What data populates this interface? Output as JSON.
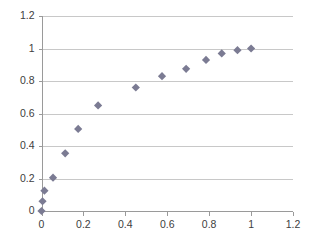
{
  "chart_data": {
    "type": "scatter",
    "title": "",
    "subtitle": "",
    "xlabel": "",
    "ylabel": "",
    "xlim": [
      0,
      1.2
    ],
    "ylim": [
      0,
      1.2
    ],
    "xticks": [
      "0",
      "0.2",
      "0.4",
      "0.6",
      "0.8",
      "1",
      "1.2"
    ],
    "xtick_values": [
      0,
      0.2,
      0.4,
      0.6,
      0.8,
      1,
      1.2
    ],
    "yticks": [
      "0",
      "0.2",
      "0.4",
      "0.6",
      "0.8",
      "1",
      "1.2"
    ],
    "ytick_values": [
      0,
      0.2,
      0.4,
      0.6,
      0.8,
      1,
      1.2
    ],
    "grid": {
      "horizontal": true,
      "vertical": false,
      "color": "#c8c8c8"
    },
    "legend": {
      "visible": false,
      "position": "none",
      "entries": []
    },
    "annotations": [],
    "series": [
      {
        "name": "Series 1",
        "marker": "diamond",
        "color": "#7b7b93",
        "marker_size": 7,
        "points": [
          {
            "x": 0.0,
            "y": 0.0
          },
          {
            "x": 0.005,
            "y": 0.06
          },
          {
            "x": 0.014,
            "y": 0.125
          },
          {
            "x": 0.055,
            "y": 0.205
          },
          {
            "x": 0.113,
            "y": 0.355
          },
          {
            "x": 0.175,
            "y": 0.505
          },
          {
            "x": 0.27,
            "y": 0.65
          },
          {
            "x": 0.45,
            "y": 0.76
          },
          {
            "x": 0.575,
            "y": 0.83
          },
          {
            "x": 0.69,
            "y": 0.875
          },
          {
            "x": 0.785,
            "y": 0.93
          },
          {
            "x": 0.86,
            "y": 0.97
          },
          {
            "x": 0.935,
            "y": 0.99
          },
          {
            "x": 1.0,
            "y": 1.0
          }
        ]
      }
    ]
  },
  "colors": {
    "marker": "#7b7b93",
    "grid": "#c8c8c8",
    "axis": "#9a9a9a",
    "tick_text": "#404040",
    "background": "#ffffff"
  }
}
